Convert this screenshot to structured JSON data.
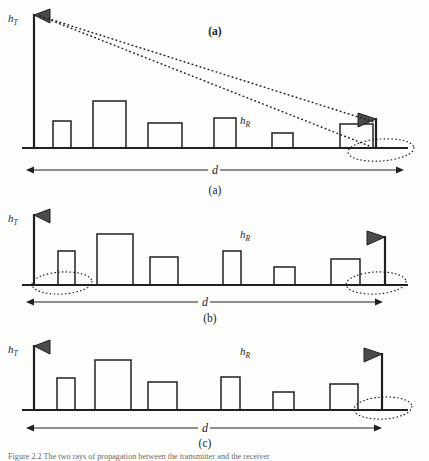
{
  "figure": {
    "domain": "Diagram",
    "background_color": "#fdfdfc",
    "ink_color": "#231f1e",
    "antenna_fill": "#4a4a4a",
    "caption_partial": "Figure 2.2  The two rays of propagation between the transmitter and the receiver"
  },
  "labels": {
    "h_t": "h",
    "h_t_sub": "T",
    "h_r": "h",
    "h_r_sub": "R",
    "distance": "d",
    "inset_tag": "(a)",
    "panel_a": "(a)",
    "panel_b": "(b)",
    "panel_c": "(c)"
  },
  "panels": [
    {
      "id": "a",
      "label": "(a)",
      "inset_label": "(a)",
      "tx": {
        "x": 34,
        "mast_top": 14,
        "base_y": 148,
        "triangle": "left"
      },
      "rx": {
        "x": 376,
        "mast_top": 118,
        "base_y": 148,
        "triangle": "right"
      },
      "ground_y": 148,
      "ground_x0": 22,
      "ground_x1": 408,
      "buildings": [
        {
          "x": 53,
          "w": 18,
          "h": 27
        },
        {
          "x": 93,
          "w": 33,
          "h": 47
        },
        {
          "x": 148,
          "w": 34,
          "h": 25
        },
        {
          "x": 214,
          "w": 22,
          "h": 30
        },
        {
          "x": 272,
          "w": 21,
          "h": 15
        },
        {
          "x": 340,
          "w": 33,
          "h": 24
        }
      ],
      "rays": [
        {
          "x1": 40,
          "y1": 16,
          "x2": 374,
          "y2": 122
        },
        {
          "x1": 40,
          "y1": 16,
          "x2": 372,
          "y2": 147
        }
      ],
      "ellipses": [
        {
          "cx": 381,
          "cy": 150,
          "rx": 33,
          "ry": 11,
          "rot": -4
        }
      ],
      "d_arrow": {
        "y": 170,
        "x0": 26,
        "x1": 404,
        "label_x": 215
      },
      "h_t_pos": {
        "x": 8,
        "y": 22
      },
      "h_r_pos": {
        "x": 240,
        "y": 124
      },
      "label_pos": {
        "x": 215,
        "y": 194
      },
      "inset_pos": {
        "x": 215,
        "y": 35
      }
    },
    {
      "id": "b",
      "label": "(b)",
      "tx": {
        "x": 34,
        "mast_top": 214,
        "base_y": 285,
        "triangle": "left"
      },
      "rx": {
        "x": 385,
        "mast_top": 236,
        "base_y": 285,
        "triangle": "right"
      },
      "ground_y": 285,
      "ground_x0": 22,
      "ground_x1": 408,
      "buildings": [
        {
          "x": 58,
          "w": 17,
          "h": 34
        },
        {
          "x": 97,
          "w": 36,
          "h": 51
        },
        {
          "x": 150,
          "w": 28,
          "h": 28
        },
        {
          "x": 223,
          "w": 18,
          "h": 34
        },
        {
          "x": 274,
          "w": 21,
          "h": 18
        },
        {
          "x": 331,
          "w": 29,
          "h": 26
        }
      ],
      "rays": [],
      "ellipses": [
        {
          "cx": 62,
          "cy": 283,
          "rx": 30,
          "ry": 11,
          "rot": -3
        },
        {
          "cx": 376,
          "cy": 283,
          "rx": 30,
          "ry": 11,
          "rot": -3
        }
      ],
      "d_arrow": {
        "y": 302,
        "x0": 26,
        "x1": 383,
        "label_x": 205
      },
      "h_t_pos": {
        "x": 8,
        "y": 222
      },
      "h_r_pos": {
        "x": 240,
        "y": 238
      },
      "label_pos": {
        "x": 210,
        "y": 322
      }
    },
    {
      "id": "c",
      "label": "(c)",
      "tx": {
        "x": 34,
        "mast_top": 345,
        "base_y": 410,
        "triangle": "left"
      },
      "rx": {
        "x": 382,
        "mast_top": 353,
        "base_y": 410,
        "triangle": "right"
      },
      "ground_y": 410,
      "ground_x0": 22,
      "ground_x1": 408,
      "buildings": [
        {
          "x": 57,
          "w": 18,
          "h": 32
        },
        {
          "x": 95,
          "w": 36,
          "h": 50
        },
        {
          "x": 148,
          "w": 29,
          "h": 28
        },
        {
          "x": 221,
          "w": 19,
          "h": 33
        },
        {
          "x": 273,
          "w": 21,
          "h": 18
        },
        {
          "x": 330,
          "w": 28,
          "h": 26
        }
      ],
      "rays": [],
      "ellipses": [
        {
          "cx": 383,
          "cy": 408,
          "rx": 29,
          "ry": 11,
          "rot": -3
        }
      ],
      "d_arrow": {
        "y": 428,
        "x0": 26,
        "x1": 382,
        "label_x": 205
      },
      "h_t_pos": {
        "x": 8,
        "y": 353
      },
      "h_r_pos": {
        "x": 240,
        "y": 355
      },
      "label_pos": {
        "x": 205,
        "y": 447
      }
    }
  ]
}
